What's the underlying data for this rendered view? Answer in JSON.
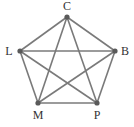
{
  "diagram": {
    "type": "complete-graph",
    "name": "K5",
    "colors": {
      "edge": "#7a7a7a",
      "node": "#5a5a5a",
      "label": "#333333"
    },
    "nodes": [
      {
        "id": "C",
        "label": "C",
        "x": 67,
        "y": 17,
        "lx": 67,
        "ly": 10
      },
      {
        "id": "L",
        "label": "L",
        "x": 20,
        "y": 51,
        "lx": 9,
        "ly": 55
      },
      {
        "id": "B",
        "label": "B",
        "x": 115,
        "y": 51,
        "lx": 125,
        "ly": 55
      },
      {
        "id": "M",
        "label": "M",
        "x": 38,
        "y": 103,
        "lx": 38,
        "ly": 119
      },
      {
        "id": "P",
        "label": "P",
        "x": 97,
        "y": 103,
        "lx": 97,
        "ly": 119
      }
    ],
    "edges": [
      [
        "C",
        "L"
      ],
      [
        "C",
        "B"
      ],
      [
        "C",
        "M"
      ],
      [
        "C",
        "P"
      ],
      [
        "L",
        "B"
      ],
      [
        "L",
        "M"
      ],
      [
        "L",
        "P"
      ],
      [
        "B",
        "M"
      ],
      [
        "B",
        "P"
      ],
      [
        "M",
        "P"
      ]
    ]
  }
}
